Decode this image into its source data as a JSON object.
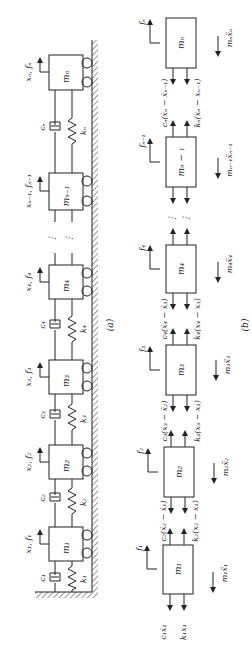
{
  "figure": {
    "orientation": "rotated-90-ccw",
    "part_a": {
      "caption": "(a)",
      "masses": [
        {
          "id": "m1",
          "label": "m₁",
          "disp_force": "x₁, f₁",
          "damper": "c₁",
          "spring": "k₁"
        },
        {
          "id": "m2",
          "label": "m₂",
          "disp_force": "x₂, f₂",
          "damper": "c₂",
          "spring": "k₂"
        },
        {
          "id": "m3",
          "label": "m₃",
          "disp_force": "x₃, f₃",
          "damper": "c₃",
          "spring": "k₃"
        },
        {
          "id": "m4",
          "label": "m₄",
          "disp_force": "x₄, f₄",
          "damper": "c₄",
          "spring": "k₄"
        },
        {
          "id": "mn1",
          "label": "mₙ₋₁",
          "disp_force": "xₙ₋₁, fₙ₋₁",
          "damper": "",
          "spring": ""
        },
        {
          "id": "mn",
          "label": "mₙ",
          "disp_force": "xₙ, fₙ",
          "damper": "cₙ",
          "spring": "kₙ"
        }
      ],
      "ellipsis": "⋮"
    },
    "part_b": {
      "caption": "(b)",
      "blocks": [
        {
          "id": "m1",
          "label": "m₁",
          "force": "f₁",
          "inertia": "m₁ẍ₁",
          "bottom_damper": "c₁ẋ₁",
          "bottom_spring": "k₁x₁",
          "top_damper": "c₂(ẋ₂ − ẋ₁)",
          "top_spring": "k₂(x₂ − x₁)"
        },
        {
          "id": "m2",
          "label": "m₂",
          "force": "f₂",
          "inertia": "m₂ẍ₂",
          "top_damper": "c₃(ẋ₃ − ẋ₂)",
          "top_spring": "k₃(x₃ − x₁)"
        },
        {
          "id": "m3",
          "label": "m₃",
          "force": "f₃",
          "inertia": "m₃ẍ₃",
          "top_damper": "c₄(ẋ₄ − ẋ₃)",
          "top_spring": "k₄(x₄ − x₃)"
        },
        {
          "id": "m4",
          "label": "m₄",
          "force": "f₄",
          "inertia": "m₄ẍ₄"
        },
        {
          "id": "mn1",
          "label": "mₙ − ₁",
          "force": "fₙ₋₁",
          "inertia": "mₙ₋₁ẍₙ₋₁",
          "top_damper": "cₙ(ẋₙ − ẋₙ₋₁)",
          "top_spring": "kₙ(xₙ − xₙ₋₁)"
        },
        {
          "id": "mn",
          "label": "mₙ",
          "force": "fₙ",
          "inertia": "mₙẍₙ"
        }
      ],
      "ellipsis": "⋮"
    }
  }
}
